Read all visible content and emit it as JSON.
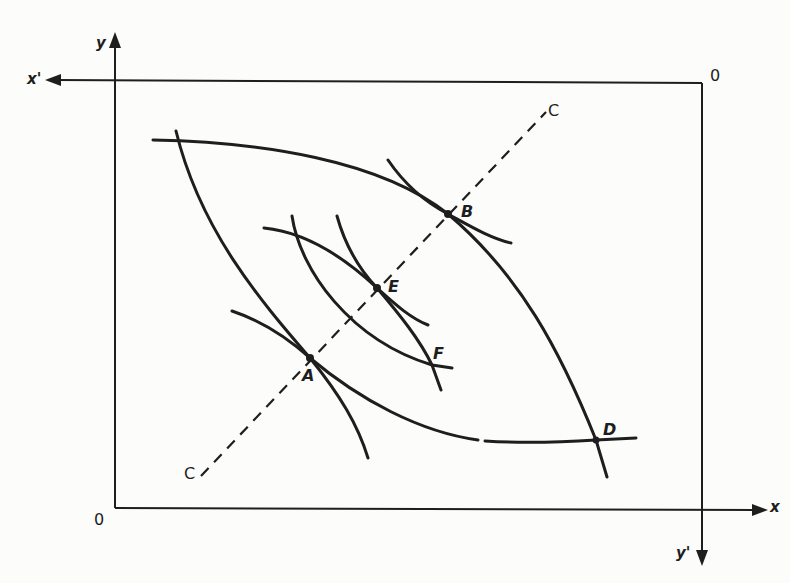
{
  "figure": {
    "type": "edgeworth-box-diagram",
    "axes": {
      "x": "x",
      "x_prime": "x'",
      "y": "y",
      "y_prime": "y'",
      "origin_bottom_left": "0",
      "origin_top_right": "0"
    },
    "contract_curve_label_top": "C",
    "contract_curve_label_bottom": "C",
    "points": {
      "A": "A",
      "B": "B",
      "D": "D",
      "E": "E",
      "F": "F"
    },
    "colors": {
      "ink": "#1e1e1e",
      "background": "#fcfcfa"
    }
  }
}
